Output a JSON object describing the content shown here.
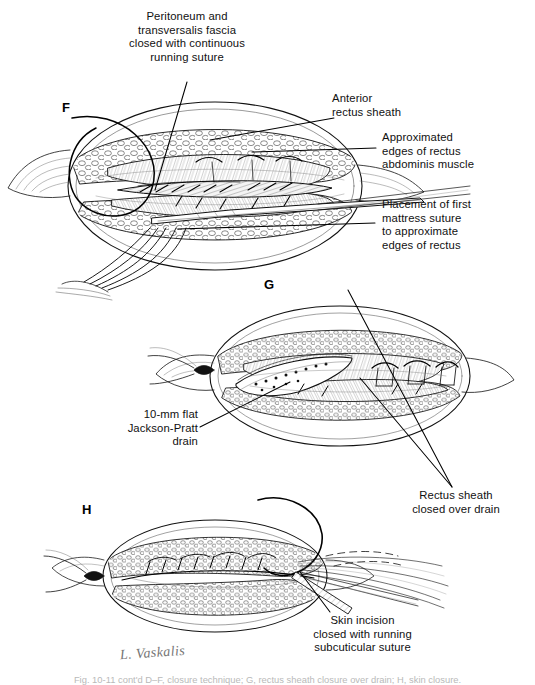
{
  "figure": {
    "type": "medical-illustration",
    "artist_signature": "L. Vaskalis",
    "caption": "Fig. 10-11 cont'd  D–F, closure technique; G, rectus sheath closure over drain; H, skin closure.",
    "background_color": "#ffffff",
    "ink_color": "#111111"
  },
  "panels": [
    {
      "id": "F",
      "label": "F"
    },
    {
      "id": "G",
      "label": "G"
    },
    {
      "id": "H",
      "label": "H"
    }
  ],
  "callouts": [
    {
      "id": "peritoneum",
      "text": "Peritoneum and\ntransversalis fascia\nclosed with continuous\nrunning suture",
      "align": "center"
    },
    {
      "id": "anterior-rectus-sheath",
      "text": "Anterior\nrectus sheath",
      "align": "left"
    },
    {
      "id": "approximated-edges",
      "text": "Approximated\nedges of rectus\nabdominis muscle",
      "align": "left"
    },
    {
      "id": "mattress-suture",
      "text": "Placement of first\nmattress suture\nto approximate\nedges of rectus",
      "align": "left"
    },
    {
      "id": "jackson-pratt-drain",
      "text": "10-mm flat\nJackson-Pratt\ndrain",
      "align": "right"
    },
    {
      "id": "rectus-sheath-over-drain",
      "text": "Rectus sheath\nclosed over drain",
      "align": "center"
    },
    {
      "id": "skin-incision",
      "text": "Skin incision\nclosed with running\nsubcuticular suture",
      "align": "center"
    }
  ]
}
